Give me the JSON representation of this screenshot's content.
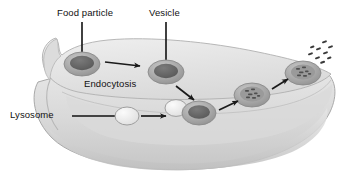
{
  "figure": {
    "title_visible": false,
    "background_color": "#ffffff"
  },
  "palette": {
    "cell_fill_light": "#e4e4e4",
    "cell_fill_mid": "#d2d2d2",
    "cell_fill_dark": "#bdbdbd",
    "cell_edge": "#a8a8a8",
    "organelle_dark": "#6e6e6e",
    "organelle_core": "#5a5a5a",
    "organelle_ring": "#b4b4b4",
    "lysosome_fill": "#f2f2f2",
    "arrow_color": "#1a1a1a",
    "leader_color": "#111111",
    "text_color": "#111111",
    "particle_color": "#3a3a3a"
  },
  "labels": [
    {
      "id": "food-particle",
      "text": "Food particle",
      "x": 57,
      "y": 8,
      "leader": "vertical"
    },
    {
      "id": "vesicle",
      "text": "Vesicle",
      "x": 149,
      "y": 8,
      "leader": "vertical"
    },
    {
      "id": "endocytosis",
      "text": "Endocytosis",
      "x": 84,
      "y": 79,
      "leader": "none"
    },
    {
      "id": "lysosome",
      "text": "Lysosome",
      "x": 10,
      "y": 110,
      "leader": "horizontal"
    }
  ],
  "leader_lines": [
    {
      "id": "leader-food-particle",
      "x1": 82,
      "y1": 22,
      "x2": 82,
      "y2": 62
    },
    {
      "id": "leader-vesicle",
      "x1": 166,
      "y1": 22,
      "x2": 166,
      "y2": 68
    },
    {
      "id": "leader-lysosome",
      "x1": 72,
      "y1": 116,
      "x2": 116,
      "y2": 116
    }
  ],
  "organelles": [
    {
      "id": "food-particle-vesicle",
      "type": "dark-concentric-oval",
      "cx": 82,
      "cy": 64,
      "rx": 18,
      "ry": 12
    },
    {
      "id": "internal-vesicle",
      "type": "dark-concentric-oval",
      "cx": 166,
      "cy": 72,
      "rx": 18,
      "ry": 12
    },
    {
      "id": "lysosome-body",
      "type": "light-oval",
      "cx": 127,
      "cy": 116,
      "rx": 12,
      "ry": 9
    },
    {
      "id": "lysosome-fusing",
      "type": "light-oval",
      "cx": 176,
      "cy": 108,
      "rx": 11,
      "ry": 8
    },
    {
      "id": "fusion-vesicle",
      "type": "dark-concentric-oval",
      "cx": 199,
      "cy": 113,
      "rx": 17,
      "ry": 12
    },
    {
      "id": "digestion-vesicle",
      "type": "speckled-oval",
      "cx": 252,
      "cy": 95,
      "rx": 18,
      "ry": 12
    },
    {
      "id": "exocytosis-vesicle",
      "type": "speckled-oval",
      "cx": 303,
      "cy": 73,
      "rx": 18,
      "ry": 12
    }
  ],
  "arrows": [
    {
      "id": "arrow-engulf-to-vesicle",
      "x1": 105,
      "y1": 62,
      "x2": 142,
      "y2": 66
    },
    {
      "id": "arrow-vesicle-descend",
      "x1": 176,
      "y1": 86,
      "x2": 196,
      "y2": 102
    },
    {
      "id": "arrow-lysosome-to-vesicle",
      "x1": 141,
      "y1": 116,
      "x2": 168,
      "y2": 116
    },
    {
      "id": "arrow-fusion-to-digestion",
      "x1": 219,
      "y1": 110,
      "x2": 240,
      "y2": 101
    },
    {
      "id": "arrow-digestion-to-exit",
      "x1": 272,
      "y1": 89,
      "x2": 290,
      "y2": 79
    }
  ],
  "released_particles": [
    {
      "cx": 311,
      "cy": 54
    },
    {
      "cx": 319,
      "cy": 49
    },
    {
      "cx": 325,
      "cy": 42
    },
    {
      "cx": 318,
      "cy": 58
    },
    {
      "cx": 326,
      "cy": 53
    },
    {
      "cx": 331,
      "cy": 47
    },
    {
      "cx": 323,
      "cy": 62
    },
    {
      "cx": 330,
      "cy": 58
    },
    {
      "cx": 313,
      "cy": 47
    }
  ]
}
